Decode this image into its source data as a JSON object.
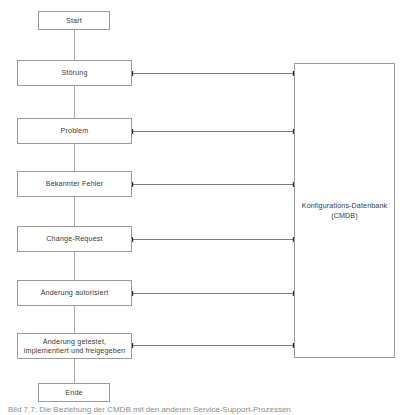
{
  "diagram": {
    "background_color": "#ffffff",
    "line_color": "#9a9a9a",
    "arrow_color": "#2b2b2b",
    "text_color": "#3b3b3b",
    "flow_nodes": [
      {
        "id": "start",
        "label": "Start",
        "shape": "terminator"
      },
      {
        "id": "stoerung",
        "label": "Störung",
        "shape": "process"
      },
      {
        "id": "problem",
        "label": "Problem",
        "shape": "process"
      },
      {
        "id": "bekannter_fehler",
        "label": "Bekannter Fehler",
        "shape": "process"
      },
      {
        "id": "change_request",
        "label": "Change-Request",
        "shape": "process"
      },
      {
        "id": "aenderung_autorisiert",
        "label": "Änderung autorisiert",
        "shape": "process"
      },
      {
        "id": "aenderung_getestet",
        "label": "Änderung getestet,\nimplementiert und freigegeben",
        "shape": "process"
      },
      {
        "id": "ende",
        "label": "Ende",
        "shape": "terminator"
      }
    ],
    "database_node": {
      "id": "cmdb",
      "label": "Konfigurations-Datenbank\n(CMDB)",
      "name_line": "Konfigurations-Datenbank",
      "abbreviation_line": "(CMDB)"
    },
    "connections": {
      "vertical_flow_label": "sequential flow",
      "bidirectional_count": 6,
      "bidirectional_from": [
        "Störung",
        "Problem",
        "Bekannter Fehler",
        "Change-Request",
        "Änderung autorisiert",
        "Änderung getestet, implementiert und freigegeben"
      ],
      "bidirectional_to": "Konfigurations-Datenbank (CMDB)"
    }
  },
  "caption": {
    "text": "Bild 7.7: Die Beziehung der CMDB mit den anderen Service-Support-Prozessen"
  }
}
